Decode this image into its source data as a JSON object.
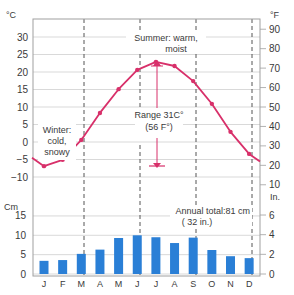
{
  "chart_data": [
    {
      "type": "line",
      "title": "Monthly mean temperature",
      "categories": [
        "J",
        "F",
        "M",
        "A",
        "M",
        "J",
        "J",
        "A",
        "S",
        "O",
        "N",
        "D"
      ],
      "series": [
        {
          "name": "Temperature (°C)",
          "values": [
            -6.9,
            -5.1,
            0.6,
            8.3,
            15.1,
            20.6,
            22.9,
            21.7,
            17.4,
            10.9,
            2.9,
            -3.4
          ]
        }
      ],
      "ylabel_left": "°C",
      "ylabel_right": "°F",
      "yticks_left": [
        30,
        25,
        20,
        15,
        10,
        5,
        0,
        -5,
        -10
      ],
      "yticks_right": [
        90,
        80,
        70,
        60,
        50,
        40,
        30,
        20,
        10
      ],
      "ylim": [
        -10,
        30
      ],
      "grid": true,
      "annotations": [
        {
          "text": "Summer: warm, moist"
        },
        {
          "text": "Winter: cold, snowy"
        },
        {
          "text": "Range 31C° (56 F°)"
        }
      ]
    },
    {
      "type": "bar",
      "title": "Monthly precipitation",
      "categories": [
        "J",
        "F",
        "M",
        "A",
        "M",
        "J",
        "J",
        "A",
        "S",
        "O",
        "N",
        "D"
      ],
      "values": [
        3.4,
        3.6,
        5.2,
        6.3,
        9.3,
        10.0,
        9.5,
        8.0,
        9.4,
        6.2,
        4.6,
        4.1
      ],
      "ylabel_left": "Cm",
      "ylabel_right": "In.",
      "yticks_left": [
        15,
        10,
        5,
        0
      ],
      "yticks_right": [
        6,
        4,
        2,
        0
      ],
      "ylim": [
        0,
        15
      ],
      "grid": true,
      "annotations": [
        {
          "text": "Annual total:81 cm"
        },
        {
          "text": "( 32 in.)"
        }
      ]
    }
  ],
  "labels": {
    "unit_c": "°C",
    "unit_f": "°F",
    "unit_cm": "Cm",
    "unit_in": "In.",
    "summer_line1": "Summer: warm,",
    "summer_line2": "moist",
    "winter_line1": "Winter:",
    "winter_line2": "cold,",
    "winter_line3": "snowy",
    "range_line1": "Range 31C°",
    "range_line2": "(56 F°)",
    "annual_line1": "Annual total:81 cm",
    "annual_line2": "( 32 in.)"
  },
  "colors": {
    "temperature_line": "#d8306a",
    "precip_bar": "#2a7fd6",
    "grid": "#cfcfcf",
    "frame": "#a0a0a0",
    "text": "#3a3a3a"
  }
}
